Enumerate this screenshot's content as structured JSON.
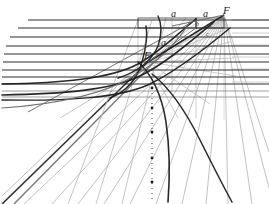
{
  "figure": {
    "background_color": "#ffffff",
    "width": 269,
    "height": 204,
    "ink_dark": "#1c1c1c",
    "ink_mid": "#6a6a6a",
    "ink_light": "#b9b9b9",
    "ink_faint": "#cfcfcf"
  },
  "labels": [
    {
      "name": "label-a-upper-left",
      "text": "a",
      "x": 161,
      "y": 38,
      "size": "a"
    },
    {
      "name": "label-a-top-middle",
      "text": "a",
      "x": 171,
      "y": 9,
      "size": "a"
    },
    {
      "name": "label-a-top-right",
      "text": "a",
      "x": 203,
      "y": 9,
      "size": "a"
    },
    {
      "name": "label-F-upper-right",
      "text": "F",
      "x": 223,
      "y": 5,
      "size": "F"
    },
    {
      "name": "label-F-inner",
      "text": "F",
      "x": 144,
      "y": 50,
      "size": "F"
    },
    {
      "name": "label-b-inner",
      "text": "b",
      "x": 196,
      "y": 21,
      "size": "small"
    },
    {
      "name": "label-c-inner-upper",
      "text": "c",
      "x": 210,
      "y": 22,
      "size": "small"
    },
    {
      "name": "label-c-inner-lower",
      "text": "c",
      "x": 206,
      "y": 31,
      "size": "small"
    }
  ],
  "chart_data": {
    "type": "line",
    "xlabel": "",
    "ylabel": "",
    "grid": true,
    "legend": "none",
    "xlim": [
      0,
      269
    ],
    "ylim": [
      0,
      204
    ],
    "horizontal_lines": [
      {
        "name": "h1",
        "y": 20,
        "x_start": 28,
        "x_end": 269,
        "weight": 1.2,
        "shade": "dark"
      },
      {
        "name": "h2",
        "y": 28,
        "x_start": 18,
        "x_end": 269,
        "weight": 1.2,
        "shade": "dark"
      },
      {
        "name": "h3",
        "y": 37,
        "x_start": 10,
        "x_end": 269,
        "weight": 1.1,
        "shade": "dark"
      },
      {
        "name": "h4",
        "y": 46,
        "x_start": 6,
        "x_end": 269,
        "weight": 1.1,
        "shade": "dark"
      },
      {
        "name": "h5",
        "y": 54,
        "x_start": 4,
        "x_end": 269,
        "weight": 1.0,
        "shade": "dark"
      },
      {
        "name": "h6",
        "y": 62,
        "x_start": 3,
        "x_end": 269,
        "weight": 1.0,
        "shade": "dark"
      },
      {
        "name": "h7",
        "y": 70,
        "x_start": 2,
        "x_end": 269,
        "weight": 1.0,
        "shade": "dark"
      },
      {
        "name": "h8",
        "y": 77,
        "x_start": 2,
        "x_end": 269,
        "weight": 1.0,
        "shade": "dark"
      },
      {
        "name": "h9",
        "y": 84,
        "x_start": 2,
        "x_end": 269,
        "weight": 1.0,
        "shade": "dark"
      },
      {
        "name": "h10",
        "y": 91,
        "x_start": 2,
        "x_end": 269,
        "weight": 0.9,
        "shade": "mid"
      },
      {
        "name": "h11",
        "y": 97,
        "x_start": 2,
        "x_end": 269,
        "weight": 0.9,
        "shade": "mid"
      }
    ],
    "right_grid_lines": [
      {
        "name": "rg1",
        "y": 20,
        "x_start": 232,
        "x_end": 269
      },
      {
        "name": "rg2",
        "y": 33,
        "x_start": 232,
        "x_end": 269
      },
      {
        "name": "rg3",
        "y": 45,
        "x_start": 232,
        "x_end": 269
      },
      {
        "name": "rg4",
        "y": 57,
        "x_start": 232,
        "x_end": 269
      },
      {
        "name": "rg5",
        "y": 69,
        "x_start": 232,
        "x_end": 269
      },
      {
        "name": "rg6",
        "y": 82,
        "x_start": 232,
        "x_end": 269
      }
    ],
    "vertical_lines": [
      {
        "name": "v1",
        "x": 138,
        "y_start": 20,
        "y_end": 78,
        "shade": "light"
      },
      {
        "name": "v2",
        "x": 172,
        "y_start": 18,
        "y_end": 92,
        "shade": "light"
      },
      {
        "name": "v3",
        "x": 196,
        "y_start": 18,
        "y_end": 118,
        "shade": "light"
      },
      {
        "name": "v4",
        "x": 224,
        "y_start": 12,
        "y_end": 120,
        "shade": "faint"
      },
      {
        "name": "v5",
        "x": 152,
        "y_start": 88,
        "y_end": 200,
        "shade": "dotted"
      }
    ],
    "boxes": [
      {
        "name": "upper-rect",
        "x": 138,
        "y": 18,
        "width": 58,
        "height": 10
      },
      {
        "name": "focus-rect",
        "x": 196,
        "y": 18,
        "width": 28,
        "height": 10
      }
    ],
    "curves": [
      {
        "name": "arc-outer",
        "d": "M 2,84 C 60,83 110,79 138,64 C 160,52 175,36 196,19",
        "weight": 1.6,
        "shade": "dark"
      },
      {
        "name": "arc-second",
        "d": "M 2,95 C 62,94 112,90 140,76 C 166,63 190,42 214,22",
        "weight": 1.6,
        "shade": "dark"
      },
      {
        "name": "arc-third",
        "d": "M 2,100 C 70,101 120,98 150,84 C 178,70 206,48 230,28",
        "weight": 1.4,
        "shade": "dark"
      },
      {
        "name": "arc-inner-loop",
        "d": "M 110,98 C 126,92 138,78 142,62 C 146,48 148,36 146,26",
        "weight": 1.5,
        "shade": "dark"
      },
      {
        "name": "arc-apex",
        "d": "M 118,78 C 138,72 152,60 158,46 C 162,34 162,24 158,16",
        "weight": 1.4,
        "shade": "dark"
      },
      {
        "name": "arc-descend-a",
        "d": "M 138,62 C 152,74 162,96 166,122 C 170,150 170,176 168,202",
        "weight": 1.6,
        "shade": "dark"
      },
      {
        "name": "arc-descend-b",
        "d": "M 152,74 C 170,88 186,112 200,140 C 212,164 222,184 232,202",
        "weight": 1.5,
        "shade": "dark"
      },
      {
        "name": "arc-crown",
        "d": "M 2,108 C 60,104 104,94 134,76 C 158,62 176,44 190,22",
        "weight": 1.2,
        "shade": "mid"
      }
    ],
    "fan_rays_from_focus": {
      "focus": {
        "x": 224,
        "y": 15
      },
      "rays": [
        {
          "name": "ray-1",
          "x2": 24,
          "y2": 204
        },
        {
          "name": "ray-2",
          "x2": 52,
          "y2": 204
        },
        {
          "name": "ray-3",
          "x2": 78,
          "y2": 204
        },
        {
          "name": "ray-4",
          "x2": 104,
          "y2": 204
        },
        {
          "name": "ray-5",
          "x2": 130,
          "y2": 204
        },
        {
          "name": "ray-6",
          "x2": 156,
          "y2": 204
        },
        {
          "name": "ray-7",
          "x2": 182,
          "y2": 204
        },
        {
          "name": "ray-8",
          "x2": 206,
          "y2": 204
        },
        {
          "name": "ray-9",
          "x2": 228,
          "y2": 204
        },
        {
          "name": "ray-10",
          "x2": 252,
          "y2": 204
        },
        {
          "name": "ray-11",
          "x2": 269,
          "y2": 188
        },
        {
          "name": "ray-12",
          "x2": 269,
          "y2": 152
        }
      ]
    },
    "secondary_rays_from_inner_focus": {
      "focus": {
        "x": 148,
        "y": 62
      },
      "rays": [
        {
          "name": "sray-1",
          "x2": 186,
          "y2": 18
        },
        {
          "name": "sray-2",
          "x2": 200,
          "y2": 20
        },
        {
          "name": "sray-3",
          "x2": 214,
          "y2": 24
        },
        {
          "name": "sray-4",
          "x2": 224,
          "y2": 30
        },
        {
          "name": "sray-5",
          "x2": 230,
          "y2": 42
        },
        {
          "name": "sray-6",
          "x2": 234,
          "y2": 58
        },
        {
          "name": "sray-7",
          "x2": 236,
          "y2": 76
        },
        {
          "name": "sray-8",
          "x2": 210,
          "y2": 104
        },
        {
          "name": "sray-9",
          "x2": 178,
          "y2": 118
        }
      ]
    },
    "chord_lines": [
      {
        "name": "chord-F-to-F",
        "x1": 148,
        "y1": 62,
        "x2": 224,
        "y2": 15,
        "weight": 1.5,
        "shade": "dark"
      },
      {
        "name": "chord-upper",
        "x1": 172,
        "y1": 26,
        "x2": 224,
        "y2": 15,
        "weight": 1.0,
        "shade": "mid"
      },
      {
        "name": "chord-lower",
        "x1": 148,
        "y1": 62,
        "x2": 196,
        "y2": 28,
        "weight": 1.0,
        "shade": "mid"
      }
    ],
    "long_diagonals": [
      {
        "name": "diag-main-1",
        "x1": 2,
        "y1": 204,
        "x2": 148,
        "y2": 62,
        "weight": 1.6,
        "shade": "dark"
      },
      {
        "name": "diag-main-2",
        "x1": 14,
        "y1": 204,
        "x2": 164,
        "y2": 52,
        "weight": 1.4,
        "shade": "mid"
      },
      {
        "name": "diag-main-3",
        "x1": 2,
        "y1": 196,
        "x2": 138,
        "y2": 66,
        "weight": 1.0,
        "shade": "light"
      },
      {
        "name": "diag-up-1",
        "x1": 28,
        "y1": 112,
        "x2": 196,
        "y2": 20,
        "weight": 1.0,
        "shade": "mid"
      },
      {
        "name": "diag-up-2",
        "x1": 60,
        "y1": 118,
        "x2": 224,
        "y2": 18,
        "weight": 0.9,
        "shade": "light"
      },
      {
        "name": "diag-down-1",
        "x1": 138,
        "y1": 20,
        "x2": 68,
        "y2": 204,
        "weight": 0.9,
        "shade": "light"
      },
      {
        "name": "diag-down-2",
        "x1": 152,
        "y1": 20,
        "x2": 96,
        "y2": 204,
        "weight": 0.9,
        "shade": "light"
      },
      {
        "name": "diag-down-3",
        "x1": 166,
        "y1": 18,
        "x2": 122,
        "y2": 204,
        "weight": 0.9,
        "shade": "light"
      }
    ],
    "marker_dots": [
      {
        "name": "dot-1",
        "x": 152,
        "y": 88
      },
      {
        "name": "dot-2",
        "x": 152,
        "y": 108
      },
      {
        "name": "dot-3",
        "x": 152,
        "y": 132
      },
      {
        "name": "dot-4",
        "x": 152,
        "y": 158
      },
      {
        "name": "dot-5",
        "x": 152,
        "y": 182
      }
    ]
  }
}
